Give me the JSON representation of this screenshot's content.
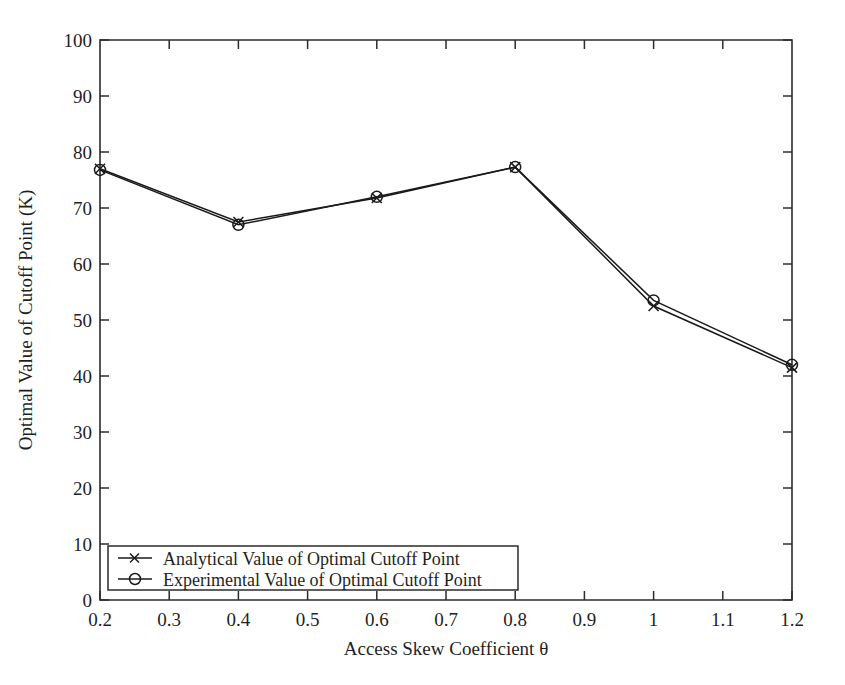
{
  "chart_data": {
    "type": "line",
    "title": "",
    "xlabel": "Access Skew Coefficient θ",
    "ylabel": "Optimal Value of Cutoff Point (K)",
    "x": [
      0.2,
      0.4,
      0.6,
      0.8,
      1.0,
      1.2
    ],
    "xlim": [
      0.2,
      1.2
    ],
    "ylim": [
      0,
      100
    ],
    "grid": false,
    "legend_position": "bottom-left",
    "xtick_labels": [
      "0.2",
      "0.3",
      "0.4",
      "0.5",
      "0.6",
      "0.7",
      "0.8",
      "0.9",
      "1",
      "1.1",
      "1.2"
    ],
    "xtick_values": [
      0.2,
      0.3,
      0.4,
      0.5,
      0.6,
      0.7,
      0.8,
      0.9,
      1.0,
      1.1,
      1.2
    ],
    "ytick_labels": [
      "0",
      "10",
      "20",
      "30",
      "40",
      "50",
      "60",
      "70",
      "80",
      "90",
      "100"
    ],
    "ytick_values": [
      0,
      10,
      20,
      30,
      40,
      50,
      60,
      70,
      80,
      90,
      100
    ],
    "series": [
      {
        "name": "Analytical Value of Optimal Cutoff Point",
        "marker": "x",
        "values": [
          77.0,
          67.5,
          71.8,
          77.3,
          52.5,
          41.5
        ]
      },
      {
        "name": "Experimental Value of Optimal Cutoff Point",
        "marker": "o",
        "values": [
          76.8,
          67.0,
          72.0,
          77.3,
          53.5,
          42.0
        ]
      }
    ]
  },
  "legend": {
    "entries": [
      {
        "label": "Analytical Value of Optimal Cutoff Point",
        "marker_name": "x-marker-icon"
      },
      {
        "label": "Experimental Value of Optimal Cutoff Point",
        "marker_name": "circle-marker-icon"
      }
    ]
  },
  "colors": {
    "line": "#1a1a1a",
    "axis": "#2b2b2b",
    "background": "#ffffff",
    "text": "#1f1f1f"
  }
}
